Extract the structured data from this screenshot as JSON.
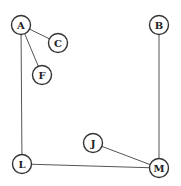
{
  "diagram": {
    "type": "graph",
    "node_radius": 9.5,
    "stroke_color": "#333333",
    "edge_color": "#555555",
    "background": "#ffffff",
    "nodes": [
      {
        "id": "A",
        "label": "A",
        "x": 21,
        "y": 25
      },
      {
        "id": "C",
        "label": "C",
        "x": 58,
        "y": 43
      },
      {
        "id": "F",
        "label": "F",
        "x": 42,
        "y": 75
      },
      {
        "id": "B",
        "label": "B",
        "x": 159,
        "y": 25
      },
      {
        "id": "J",
        "label": "J",
        "x": 93,
        "y": 143
      },
      {
        "id": "L",
        "label": "L",
        "x": 22,
        "y": 164
      },
      {
        "id": "M",
        "label": "M",
        "x": 159,
        "y": 168
      }
    ],
    "edges": [
      {
        "from": "A",
        "to": "C"
      },
      {
        "from": "A",
        "to": "F"
      },
      {
        "from": "A",
        "to": "L"
      },
      {
        "from": "B",
        "to": "M"
      },
      {
        "from": "L",
        "to": "M"
      },
      {
        "from": "J",
        "to": "M"
      }
    ]
  }
}
